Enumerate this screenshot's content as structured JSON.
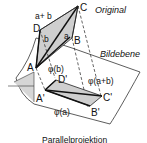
{
  "diagram": {
    "title_original": "Original",
    "title_plane": "Bildebene",
    "caption": "Parallelprojektion",
    "points": {
      "A": "A",
      "B": "B",
      "C": "C",
      "D": "D",
      "A_prime": "A'",
      "B_prime": "B'",
      "C_prime": "C'",
      "D_prime": "D'"
    },
    "vectors": {
      "a": "a",
      "b": "b",
      "a_plus_b": "a+ b",
      "phi_a": "φ(a)",
      "phi_b": "φ(b)",
      "phi_a_plus_b": "φ(a+b)"
    },
    "colors": {
      "fill": "#cfcfcf",
      "stroke": "#222222"
    }
  }
}
